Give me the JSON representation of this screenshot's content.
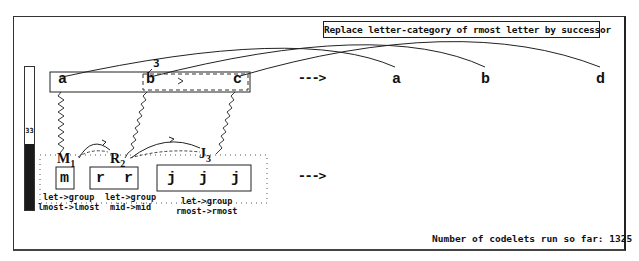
{
  "rule": {
    "text": "Replace letter-category of rmost letter by successor"
  },
  "temperature": {
    "value": "33",
    "fill_percent": 46
  },
  "initial_string": {
    "letters": [
      "a",
      "b",
      "c"
    ],
    "bond_label": "3"
  },
  "modified_string": {
    "letters": [
      "a",
      "b",
      "d"
    ]
  },
  "target_string": {
    "letters": [
      "m",
      "r",
      "r",
      "j",
      "j",
      "j"
    ],
    "groups": [
      {
        "label": "M",
        "subscript": "1"
      },
      {
        "label": "R",
        "subscript": "2"
      },
      {
        "label": "J",
        "subscript": "3"
      }
    ],
    "descriptions": [
      {
        "line1": "let->group",
        "line2": "lmost->lmost"
      },
      {
        "line1": "let->group",
        "line2": "mid->mid"
      },
      {
        "line1": "let->group",
        "line2": "rmost->rmost"
      }
    ]
  },
  "arrows": {
    "top": "--->",
    "bottom": "--->"
  },
  "status": {
    "codelets_label": "Number of codelets run so far:",
    "codelets_count": "1325"
  }
}
